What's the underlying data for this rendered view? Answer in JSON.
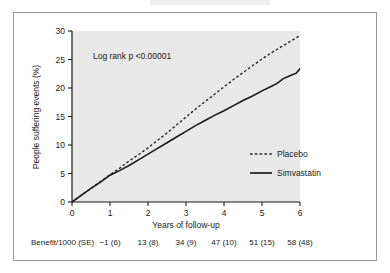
{
  "figure": {
    "kind": "kaplan-meier-cumulative-event-chart",
    "background_color": "#ffffff",
    "plot_background_color": "#e8e8e8",
    "axis_color": "#1a1a1a",
    "border_color": "#9a9a9a"
  },
  "chart_data": {
    "type": "line",
    "title": "",
    "xlabel": "Years of follow-up",
    "ylabel": "People suffering events (%)",
    "xlim": [
      0,
      6
    ],
    "ylim": [
      0,
      30
    ],
    "xticks": [
      "0",
      "1",
      "2",
      "3",
      "4",
      "5",
      "6"
    ],
    "xtick_values": [
      0,
      1,
      2,
      3,
      4,
      5,
      6
    ],
    "yticks": [
      "0",
      "5",
      "10",
      "15",
      "20",
      "25",
      "30"
    ],
    "ytick_values": [
      0,
      5,
      10,
      15,
      20,
      25,
      30
    ],
    "grid": false,
    "legend_position": "center-right",
    "annotations": [
      {
        "name": "log-rank-annotation",
        "text": "Log rank p <0.00001",
        "x": 0.55,
        "y": 25.2
      }
    ],
    "series": [
      {
        "name": "Placebo",
        "style": "dashed",
        "color": "#2b2b2b",
        "x": [
          0,
          0.25,
          0.5,
          0.75,
          1.0,
          1.25,
          1.5,
          1.75,
          2.0,
          2.25,
          2.5,
          2.75,
          3.0,
          3.25,
          3.5,
          3.75,
          4.0,
          4.25,
          4.5,
          4.75,
          5.0,
          5.25,
          5.5,
          5.75,
          6.0
        ],
        "values": [
          0,
          1.2,
          2.4,
          3.6,
          4.8,
          5.9,
          7.2,
          8.3,
          9.5,
          10.8,
          12.1,
          13.5,
          14.9,
          16.3,
          17.6,
          18.9,
          20.2,
          21.5,
          22.7,
          23.9,
          25.1,
          26.2,
          27.2,
          28.2,
          29.2
        ]
      },
      {
        "name": "Simvastatin",
        "style": "solid",
        "color": "#1a1a1a",
        "x": [
          0,
          0.25,
          0.5,
          0.75,
          1.0,
          1.25,
          1.5,
          1.75,
          2.0,
          2.25,
          2.5,
          2.75,
          3.0,
          3.25,
          3.5,
          3.75,
          4.0,
          4.25,
          4.5,
          4.75,
          5.0,
          5.25,
          5.4,
          5.55,
          5.75,
          5.9,
          6.0
        ],
        "values": [
          0,
          1.2,
          2.4,
          3.5,
          4.7,
          5.5,
          6.4,
          7.4,
          8.4,
          9.4,
          10.4,
          11.4,
          12.4,
          13.4,
          14.3,
          15.2,
          16.0,
          16.9,
          17.8,
          18.6,
          19.5,
          20.3,
          20.8,
          21.6,
          22.2,
          22.6,
          23.4
        ]
      }
    ]
  },
  "legend": {
    "items": [
      {
        "label": "Placebo",
        "style": "dashed"
      },
      {
        "label": "Simvastatin",
        "style": "solid"
      }
    ]
  },
  "benefit_row": {
    "label": "Benefit/1000 (SE)",
    "values": [
      {
        "year": 1,
        "text": "−1 (6)"
      },
      {
        "year": 2,
        "text": "13 (8)"
      },
      {
        "year": 3,
        "text": "34 (9)"
      },
      {
        "year": 4,
        "text": "47 (10)"
      },
      {
        "year": 5,
        "text": "51 (15)"
      },
      {
        "year": 6,
        "text": "58 (48)"
      }
    ]
  }
}
